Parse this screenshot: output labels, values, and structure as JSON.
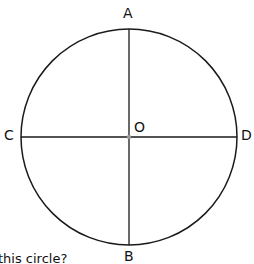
{
  "diagram": {
    "type": "circle-with-diameters",
    "center_label": "O",
    "points": {
      "top": "A",
      "bottom": "B",
      "left": "C",
      "right": "D"
    },
    "colors": {
      "stroke": "#1a1a1a",
      "center_dot": "#999999"
    }
  },
  "question_fragment": "this circle?"
}
